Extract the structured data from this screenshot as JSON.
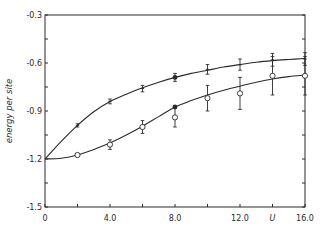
{
  "chart_data": {
    "type": "line",
    "title": "",
    "xlabel": "U",
    "ylabel": "energy per site",
    "xlim": [
      0,
      16.0
    ],
    "ylim": [
      -1.5,
      -0.3
    ],
    "x_ticks": [
      "0",
      "4.0",
      "8.0",
      "12.0",
      "16.0"
    ],
    "x_tick_values": [
      0,
      4,
      8,
      12,
      16
    ],
    "x_minor_ticks": [
      2,
      6,
      10,
      14
    ],
    "y_ticks": [
      "-0.3",
      "-0.6",
      "-0.9",
      "-1.2",
      "-1.5"
    ],
    "y_tick_values": [
      -0.3,
      -0.6,
      -0.9,
      -1.2,
      -1.5
    ],
    "y_minor_ticks": [
      -0.45,
      -0.75,
      -1.05,
      -1.35
    ],
    "grid": false,
    "legend": null,
    "series": [
      {
        "name": "upper curve (exact)",
        "style": "line",
        "x": [
          0,
          1,
          2,
          3,
          4,
          5,
          6,
          7,
          8,
          9,
          10,
          11,
          12,
          13,
          14,
          15,
          16
        ],
        "values": [
          -1.2,
          -1.09,
          -0.99,
          -0.905,
          -0.84,
          -0.795,
          -0.755,
          -0.72,
          -0.69,
          -0.665,
          -0.645,
          -0.625,
          -0.61,
          -0.595,
          -0.585,
          -0.578,
          -0.572
        ]
      },
      {
        "name": "upper data (crosses)",
        "style": "points-errorbar",
        "marker": "cross",
        "x": [
          2,
          4,
          6,
          8,
          10,
          12,
          14,
          16
        ],
        "values": [
          -0.99,
          -0.84,
          -0.76,
          -0.69,
          -0.64,
          -0.61,
          -0.58,
          -0.575
        ],
        "errors": [
          0.01,
          0.015,
          0.02,
          0.025,
          0.03,
          0.035,
          0.04,
          0.04
        ]
      },
      {
        "name": "upper filled point",
        "style": "points",
        "marker": "filled-circle",
        "x": [
          8
        ],
        "values": [
          -0.69
        ]
      },
      {
        "name": "lower curve (exact)",
        "style": "line",
        "x": [
          0,
          1,
          2,
          3,
          4,
          5,
          6,
          7,
          8,
          9,
          10,
          11,
          12,
          13,
          14,
          15,
          16
        ],
        "values": [
          -1.2,
          -1.195,
          -1.175,
          -1.14,
          -1.1,
          -1.05,
          -0.995,
          -0.935,
          -0.875,
          -0.835,
          -0.8,
          -0.77,
          -0.745,
          -0.72,
          -0.7,
          -0.685,
          -0.675
        ]
      },
      {
        "name": "lower data (open circles)",
        "style": "points-errorbar",
        "marker": "open-circle",
        "x": [
          2,
          4,
          6,
          8,
          10,
          12,
          14,
          16
        ],
        "values": [
          -1.175,
          -1.11,
          -1.0,
          -0.94,
          -0.82,
          -0.79,
          -0.68,
          -0.68
        ],
        "errors": [
          0.01,
          0.03,
          0.04,
          0.06,
          0.08,
          0.1,
          0.12,
          0.12
        ]
      },
      {
        "name": "lower filled point",
        "style": "points",
        "marker": "filled-circle",
        "x": [
          8
        ],
        "values": [
          -0.875
        ]
      }
    ]
  },
  "layout": {
    "plot_left": 45,
    "plot_right": 305,
    "plot_top": 15,
    "plot_bottom": 207,
    "line_color": "#2a2a2a"
  }
}
